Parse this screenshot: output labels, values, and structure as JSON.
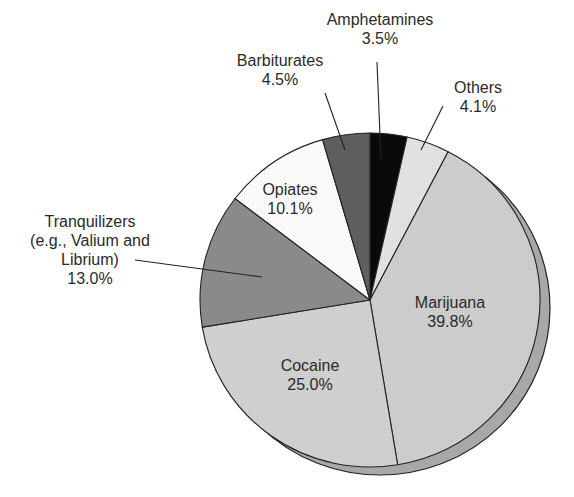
{
  "chart_data": {
    "type": "pie",
    "title": "",
    "style": "3d-tilted",
    "start_angle_deg": 0,
    "direction": "clockwise",
    "legend": "none (direct labels)",
    "slices": [
      {
        "label": "Amphetamines",
        "value": 3.5,
        "value_label": "3.5%",
        "fill": "#0a0a0a",
        "label_inside": false
      },
      {
        "label": "Others",
        "value": 4.1,
        "value_label": "4.1%",
        "fill": "#e4e4e4",
        "label_inside": false
      },
      {
        "label": "Marijuana",
        "value": 39.8,
        "value_label": "39.8%",
        "fill": "#cfcfcf",
        "label_inside": true
      },
      {
        "label": "Cocaine",
        "value": 25.0,
        "value_label": "25.0%",
        "fill": "#d2d2d2",
        "label_inside": true
      },
      {
        "label": "Tranquilizers (e.g., Valium and Librium)",
        "value": 13.0,
        "value_label": "13.0%",
        "fill": "#8c8c8c",
        "label_inside": false
      },
      {
        "label": "Opiates",
        "value": 10.1,
        "value_label": "10.1%",
        "fill": "#ffffff",
        "label_inside": true
      },
      {
        "label": "Barbiturates",
        "value": 4.5,
        "value_label": "4.5%",
        "fill": "#606060",
        "label_inside": false
      }
    ],
    "shadow_fill": "#a8a8a8"
  },
  "labels": {
    "amphetamines": {
      "name": "Amphetamines",
      "pct": "3.5%"
    },
    "others": {
      "name": "Others",
      "pct": "4.1%"
    },
    "marijuana": {
      "name": "Marijuana",
      "pct": "39.8%"
    },
    "cocaine": {
      "name": "Cocaine",
      "pct": "25.0%"
    },
    "tranquilizers": {
      "line1": "Tranquilizers",
      "line2": "(e.g., Valium and",
      "line3": "Librium)",
      "pct": "13.0%"
    },
    "opiates": {
      "name": "Opiates",
      "pct": "10.1%"
    },
    "barbiturates": {
      "name": "Barbiturates",
      "pct": "4.5%"
    }
  }
}
